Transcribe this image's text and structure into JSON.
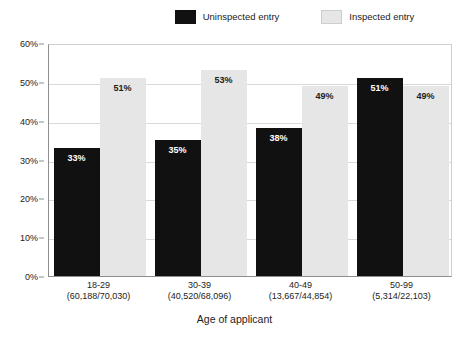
{
  "chart_data": {
    "type": "bar",
    "title": "",
    "xlabel": "Age of applicant",
    "ylabel": "",
    "categories": [
      "18-29",
      "30-39",
      "40-49",
      "50-99"
    ],
    "category_sublabels": [
      "(60,188/70,030)",
      "(40,520/68,096)",
      "(13,667/44,854)",
      "(5,314/22,103)"
    ],
    "series": [
      {
        "name": "Uninspected entry",
        "color": "#111111",
        "values": [
          33,
          35,
          38,
          51
        ],
        "labels": [
          "33%",
          "35%",
          "38%",
          "51%"
        ]
      },
      {
        "name": "Inspected entry",
        "color": "#e6e6e6",
        "values": [
          51,
          53,
          49,
          49
        ],
        "labels": [
          "51%",
          "53%",
          "49%",
          "49%"
        ]
      }
    ],
    "ylim": [
      0,
      60
    ],
    "ytick_values": [
      0,
      10,
      20,
      30,
      40,
      50,
      60
    ],
    "ytick_labels": [
      "0%",
      "10%",
      "20%",
      "30%",
      "40%",
      "50%",
      "60%"
    ],
    "grid": true,
    "legend_position": "top-right"
  },
  "legend": {
    "items": [
      {
        "label": "Uninspected entry",
        "color": "#111111"
      },
      {
        "label": "Inspected entry",
        "color": "#e6e6e6"
      }
    ]
  },
  "axis": {
    "x_title": "Age of applicant"
  }
}
